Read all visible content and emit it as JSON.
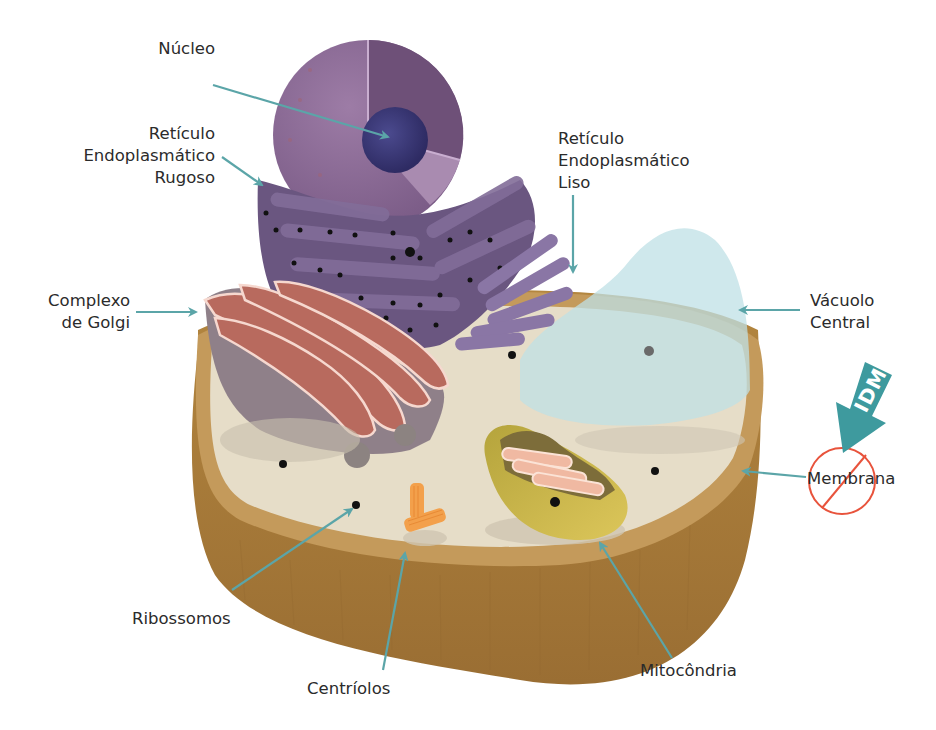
{
  "diagram": {
    "title": "",
    "language": "pt-BR",
    "colors": {
      "arrow": "#5ba5a8",
      "cytoplasm": "#e6ddc8",
      "cell_wall_side": "#a67a3c",
      "cell_wall_top": "#c4975a",
      "nucleus": "#8c6a94",
      "nucleolus": "#3d3a7a",
      "er": "#6f5a84",
      "golgi_outer": "#8f8089",
      "golgi_inner": "#b86a5e",
      "vacuole": "#bfe0e6",
      "mitochondria": "#c9b64a",
      "mito_cristae": "#f0b9a2",
      "centriole": "#f3a04b",
      "ribosome": "#1a1a1a",
      "stamp_arrow": "#3e9a9e",
      "stamp_circle": "#e8533c"
    },
    "labels": {
      "nucleo": "Núcleo",
      "rer": [
        "Retículo",
        "Endoplasmático",
        "Rugoso"
      ],
      "ser": [
        "Retículo",
        "Endoplasmático",
        "Liso"
      ],
      "golgi": [
        "Complexo",
        "de Golgi"
      ],
      "vacuolo": [
        "Vácuolo",
        "Central"
      ],
      "membrana": "Membrana",
      "ribossomos": "Ribossomos",
      "centriolos": "Centríolos",
      "mitocondria": "Mitocôndria"
    },
    "watermark": {
      "text": "IDM"
    }
  }
}
